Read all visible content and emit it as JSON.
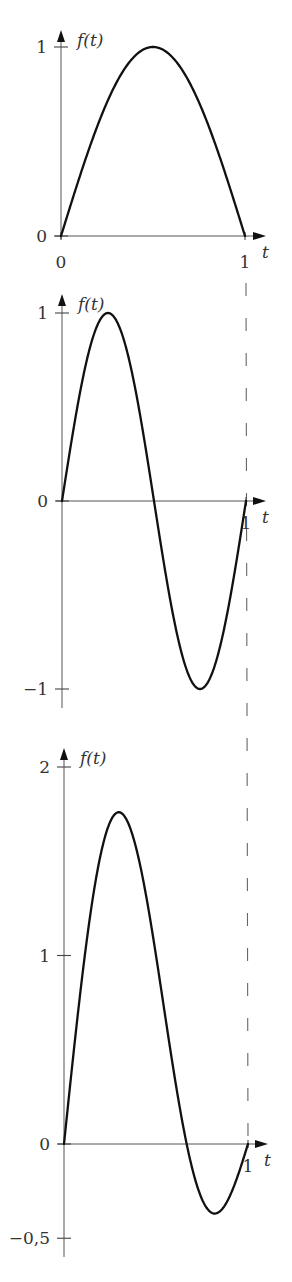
{
  "figure": {
    "dashed_line": {
      "at_t": 1,
      "color": "#666666"
    }
  },
  "chart_data": [
    {
      "type": "line",
      "title": "",
      "xlabel": "t",
      "ylabel": "f(t)",
      "formula": "sin(pi t)",
      "xlim": [
        0,
        1
      ],
      "ylim": [
        0,
        1
      ],
      "x_ticks": [
        {
          "value": 0,
          "label": "0"
        },
        {
          "value": 1,
          "label": "1"
        }
      ],
      "y_ticks": [
        {
          "value": 0,
          "label": "0"
        },
        {
          "value": 1,
          "label": "1"
        }
      ],
      "grid": false,
      "series": [
        {
          "name": "f(t)",
          "x": [
            0,
            0.1,
            0.2,
            0.3,
            0.4,
            0.5,
            0.6,
            0.7,
            0.8,
            0.9,
            1.0
          ],
          "values": [
            0,
            0.31,
            0.59,
            0.81,
            0.95,
            1.0,
            0.95,
            0.81,
            0.59,
            0.31,
            0
          ]
        }
      ],
      "layout": {
        "origin_px": [
          61,
          236
        ],
        "t1_px": 245,
        "px_per_unit_y": 189,
        "y_axis_top": 30,
        "x_axis_end": 266
      }
    },
    {
      "type": "line",
      "title": "",
      "xlabel": "t",
      "ylabel": "f(t)",
      "formula": "sin(2 pi t)",
      "xlim": [
        0,
        1
      ],
      "ylim": [
        -1,
        1
      ],
      "x_ticks": [
        {
          "value": 1,
          "label": "1"
        }
      ],
      "y_ticks": [
        {
          "value": -1,
          "label": "−1"
        },
        {
          "value": 0,
          "label": "0"
        },
        {
          "value": 1,
          "label": "1"
        }
      ],
      "grid": false,
      "series": [
        {
          "name": "f(t)",
          "x": [
            0,
            0.1,
            0.2,
            0.25,
            0.3,
            0.4,
            0.5,
            0.6,
            0.7,
            0.75,
            0.8,
            0.9,
            1.0
          ],
          "values": [
            0,
            0.59,
            0.95,
            1.0,
            0.95,
            0.59,
            0,
            -0.59,
            -0.95,
            -1.0,
            -0.95,
            -0.59,
            0
          ]
        }
      ],
      "layout": {
        "origin_px": [
          62,
          501
        ],
        "t1_px": 246,
        "px_per_unit_y": 188,
        "y_axis_top": 294,
        "y_axis_bottom": 708,
        "x_axis_end": 266
      }
    },
    {
      "type": "line",
      "title": "",
      "xlabel": "t",
      "ylabel": "f(t)",
      "formula": "sin(pi t) + sin(2 pi t)",
      "xlim": [
        0,
        1
      ],
      "ylim": [
        -0.5,
        2
      ],
      "x_ticks": [
        {
          "value": 1,
          "label": "1"
        }
      ],
      "y_ticks": [
        {
          "value": -0.5,
          "label": "−0,5"
        },
        {
          "value": 0,
          "label": "0"
        },
        {
          "value": 1,
          "label": "1"
        },
        {
          "value": 2,
          "label": "2"
        }
      ],
      "grid": false,
      "series": [
        {
          "name": "f(t)",
          "x": [
            0,
            0.1,
            0.2,
            0.27,
            0.3,
            0.4,
            0.5,
            0.6,
            0.67,
            0.7,
            0.8,
            0.82,
            0.9,
            1.0
          ],
          "values": [
            0,
            0.9,
            1.54,
            1.76,
            1.76,
            1.54,
            1.0,
            0.36,
            0.0,
            -0.14,
            -0.36,
            -0.37,
            -0.28,
            0
          ]
        }
      ],
      "layout": {
        "origin_px": [
          64,
          1144
        ],
        "t1_px": 248,
        "px_per_unit_y": 188.5,
        "y_axis_top": 748,
        "y_axis_bottom": 1257,
        "x_axis_end": 268
      }
    }
  ]
}
